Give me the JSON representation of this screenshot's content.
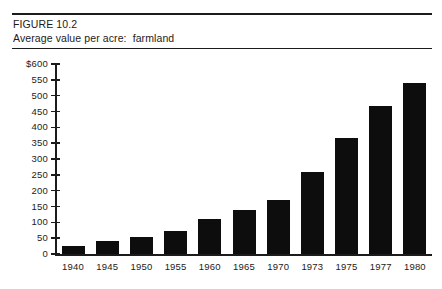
{
  "figure": {
    "number_line": "FIGURE 10.2",
    "caption_line": "Average value per acre:  farmland"
  },
  "colors": {
    "bar": "#0d0d0d",
    "axis": "#1b1b1b",
    "background": "#ffffff",
    "rule": "#1b1b1b"
  },
  "chart_data": {
    "type": "bar",
    "title": "Average value per acre:  farmland",
    "subtitle": "FIGURE 10.2",
    "xlabel": "",
    "ylabel": "",
    "categories": [
      "1940",
      "1945",
      "1950",
      "1955",
      "1960",
      "1965",
      "1970",
      "1973",
      "1975",
      "1977",
      "1980"
    ],
    "values": [
      25,
      40,
      55,
      72,
      110,
      140,
      172,
      260,
      365,
      467,
      540
    ],
    "ylim": [
      0,
      600
    ],
    "ytick_values": [
      0,
      50,
      100,
      150,
      200,
      250,
      300,
      350,
      400,
      450,
      500,
      550,
      600
    ],
    "ytick_labels": [
      "0",
      "50",
      "100",
      "150",
      "200",
      "250",
      "300",
      "350",
      "400",
      "450",
      "500",
      "550",
      "$600"
    ],
    "grid": false,
    "legend": null,
    "series": [
      {
        "name": "Average value per acre",
        "values": [
          25,
          40,
          55,
          72,
          110,
          140,
          172,
          260,
          365,
          467,
          540
        ]
      }
    ]
  }
}
